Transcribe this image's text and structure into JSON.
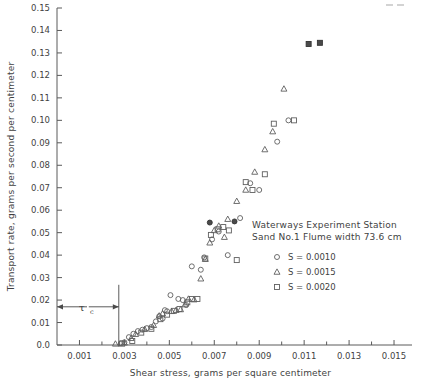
{
  "chart_data": {
    "type": "scatter",
    "title": "",
    "xlabel": "Shear stress, grams per square centimeter",
    "ylabel": "Transport rate, grams per second per centimeter",
    "xlim": [
      0.0,
      0.0158
    ],
    "ylim": [
      0.0,
      0.15
    ],
    "xticks": [
      0.001,
      0.003,
      0.005,
      0.007,
      0.009,
      0.011,
      0.013,
      0.015
    ],
    "xticklabels": [
      "0.001",
      "0.003",
      "0.005",
      "0.007",
      "0.009",
      "0.011",
      "0.013",
      "0.015"
    ],
    "xminorticks": [
      0.002,
      0.004,
      0.006,
      0.008,
      0.01,
      0.012,
      0.014
    ],
    "yticks": [
      0.0,
      0.01,
      0.02,
      0.03,
      0.04,
      0.05,
      0.06,
      0.07,
      0.08,
      0.09,
      0.1,
      0.11,
      0.12,
      0.13,
      0.14,
      0.15
    ],
    "yticklabels": [
      "0.0",
      "0.01",
      "0.02",
      "0.03",
      "0.04",
      "0.05",
      "0.06",
      "0.07",
      "0.08",
      "0.09",
      "0.10",
      "0.11",
      "0.12",
      "0.13",
      "0.14",
      "0.15"
    ],
    "grid": false,
    "legend_position": "inside-right",
    "annotation": {
      "label": "tau",
      "subscript": "c",
      "x_start": 0.0,
      "x_end": 0.00275,
      "y": 0.017
    },
    "series": [
      {
        "name": "S = 0.0010",
        "marker": "circle",
        "points": [
          [
            0.00285,
            0.0008
          ],
          [
            0.003,
            0.0012
          ],
          [
            0.0032,
            0.0035
          ],
          [
            0.0034,
            0.005
          ],
          [
            0.0036,
            0.0062
          ],
          [
            0.0038,
            0.0068
          ],
          [
            0.004,
            0.0075
          ],
          [
            0.0042,
            0.008
          ],
          [
            0.0044,
            0.0105
          ],
          [
            0.0047,
            0.0118
          ],
          [
            0.0049,
            0.015
          ],
          [
            0.00505,
            0.0222
          ],
          [
            0.0054,
            0.0205
          ],
          [
            0.0056,
            0.02
          ],
          [
            0.00575,
            0.0178
          ],
          [
            0.0048,
            0.0155
          ],
          [
            0.00455,
            0.0128
          ],
          [
            0.006,
            0.035
          ],
          [
            0.0064,
            0.0335
          ],
          [
            0.00655,
            0.039
          ],
          [
            0.0068,
            0.0545
          ],
          [
            0.0069,
            0.047
          ],
          [
            0.0072,
            0.0505
          ],
          [
            0.0076,
            0.04
          ],
          [
            0.0079,
            0.055
          ],
          [
            0.00815,
            0.0565
          ],
          [
            0.0086,
            0.072
          ],
          [
            0.009,
            0.069
          ],
          [
            0.0098,
            0.0905
          ],
          [
            0.0103,
            0.1
          ]
        ]
      },
      {
        "name": "S = 0.0015",
        "marker": "triangle",
        "points": [
          [
            0.0026,
            0.0005
          ],
          [
            0.003,
            0.001
          ],
          [
            0.0033,
            0.003
          ],
          [
            0.0035,
            0.0048
          ],
          [
            0.0039,
            0.007
          ],
          [
            0.0043,
            0.0088
          ],
          [
            0.00455,
            0.013
          ],
          [
            0.0047,
            0.014
          ],
          [
            0.0051,
            0.015
          ],
          [
            0.0053,
            0.0155
          ],
          [
            0.0055,
            0.0158
          ],
          [
            0.0057,
            0.018
          ],
          [
            0.00585,
            0.0205
          ],
          [
            0.0061,
            0.0202
          ],
          [
            0.0064,
            0.0295
          ],
          [
            0.0066,
            0.0382
          ],
          [
            0.0068,
            0.0455
          ],
          [
            0.007,
            0.051
          ],
          [
            0.0072,
            0.053
          ],
          [
            0.0076,
            0.056
          ],
          [
            0.008,
            0.064
          ],
          [
            0.0084,
            0.069
          ],
          [
            0.0088,
            0.077
          ],
          [
            0.00925,
            0.087
          ],
          [
            0.0096,
            0.095
          ],
          [
            0.0101,
            0.114
          ],
          [
            0.00745,
            0.048
          ]
        ]
      },
      {
        "name": "S = 0.0020",
        "marker": "square",
        "points": [
          [
            0.0029,
            0.0006
          ],
          [
            0.00335,
            0.0018
          ],
          [
            0.00375,
            0.0055
          ],
          [
            0.0042,
            0.0072
          ],
          [
            0.0046,
            0.0115
          ],
          [
            0.0049,
            0.0135
          ],
          [
            0.0052,
            0.0152
          ],
          [
            0.00545,
            0.016
          ],
          [
            0.0058,
            0.019
          ],
          [
            0.006,
            0.0205
          ],
          [
            0.00625,
            0.0205
          ],
          [
            0.0066,
            0.0385
          ],
          [
            0.00685,
            0.049
          ],
          [
            0.00715,
            0.0515
          ],
          [
            0.0074,
            0.0525
          ],
          [
            0.00765,
            0.051
          ],
          [
            0.008,
            0.0378
          ],
          [
            0.0084,
            0.0725
          ],
          [
            0.0087,
            0.069
          ],
          [
            0.00925,
            0.076
          ],
          [
            0.00965,
            0.0985
          ],
          [
            0.01055,
            0.1
          ],
          [
            0.0112,
            0.134
          ],
          [
            0.0117,
            0.1345
          ]
        ]
      }
    ],
    "legend": {
      "header_line1": "Waterways Experiment Station",
      "header_line2": "Sand No.1  Flume width 73.6 cm",
      "entries": [
        {
          "marker": "circle",
          "label": "S = 0.0010"
        },
        {
          "marker": "triangle",
          "label": "S = 0.0015"
        },
        {
          "marker": "square",
          "label": "S = 0.0020"
        }
      ]
    }
  }
}
